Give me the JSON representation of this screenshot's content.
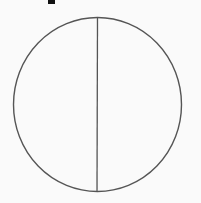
{
  "diagram": {
    "shape": "circle",
    "parts": 2,
    "divider": "vertical",
    "stroke_color": "#555555",
    "background_color": "#fafafa",
    "fragment_color": "#111111"
  }
}
